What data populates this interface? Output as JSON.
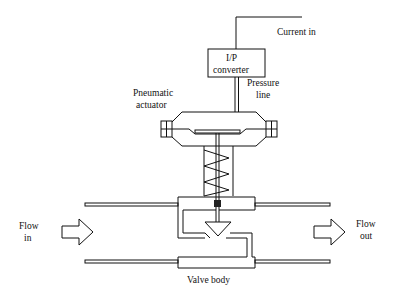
{
  "diagram": {
    "labels": {
      "current_in": "Current in",
      "ip_line1": "I/P",
      "ip_line2": "converter",
      "pressure_line1": "Pressure",
      "pressure_line2": "line",
      "actuator_line1": "Pneumatic",
      "actuator_line2": "actuator",
      "flow_in_line1": "Flow",
      "flow_in_line2": "in",
      "flow_out_line1": "Flow",
      "flow_out_line2": "out",
      "valve_body": "Valve body"
    },
    "components": [
      "current-signal-line",
      "ip-converter",
      "pressure-line",
      "pneumatic-actuator",
      "diaphragm",
      "spring",
      "valve-stem",
      "valve-plug",
      "valve-body",
      "inlet-pipe",
      "outlet-pipe",
      "flow-in-arrow",
      "flow-out-arrow"
    ],
    "colors": {
      "stroke": "#111111",
      "background": "#ffffff"
    }
  }
}
